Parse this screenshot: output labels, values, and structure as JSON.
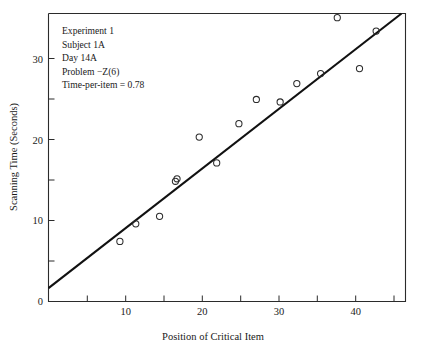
{
  "chart_data": {
    "type": "scatter",
    "title": "",
    "xlabel": "Position of Critical Item",
    "ylabel": "Scanning Time (Seconds)",
    "xlim": [
      0,
      45
    ],
    "ylim": [
      0,
      34.5
    ],
    "grid": false,
    "legend": "none",
    "x_major_ticks": [
      10,
      20,
      30,
      40
    ],
    "x_major_tick_labels": [
      "10",
      "20",
      "30",
      "40"
    ],
    "x_minor_ticks": [
      5,
      15,
      25,
      35,
      45
    ],
    "y_major_ticks": [
      0,
      10,
      20,
      30
    ],
    "y_major_tick_labels": [
      "0",
      "10",
      "20",
      "30"
    ],
    "y_minor_ticks": [
      5,
      15,
      25
    ],
    "series": [
      {
        "name": "observations",
        "marker": "open-circle",
        "x": [
          9,
          11,
          14,
          16,
          16.2,
          19,
          21.2,
          24,
          26.2,
          29.2,
          31.3,
          34.3,
          36.4,
          39.2,
          41.3
        ],
        "y": [
          7.2,
          9.3,
          10.2,
          14.4,
          14.7,
          19.7,
          16.6,
          21.3,
          24.2,
          23.9,
          26.1,
          27.3,
          34.0,
          27.9,
          32.4
        ]
      }
    ],
    "fit_line": {
      "name": "least-squares fit",
      "x": [
        0,
        44.5
      ],
      "y": [
        1.6,
        34.5
      ],
      "slope": 0.74,
      "intercept": 1.6
    }
  },
  "annotation": {
    "lines": [
      "Experiment 1",
      "Subject 1A",
      "Day 14A",
      "Problem −Z(6)",
      "Time-per-item = 0.78"
    ],
    "line_0": "Experiment 1",
    "line_1": "Subject 1A",
    "line_2": "Day 14A",
    "line_3": "Problem −Z(6)",
    "line_4": "Time-per-item = 0.78"
  },
  "colors": {
    "axis": "#2b2b2b",
    "fit_line": "#111111",
    "marker": "#2b2b2b",
    "background": "#ffffff",
    "text": "#1a1a1a"
  }
}
